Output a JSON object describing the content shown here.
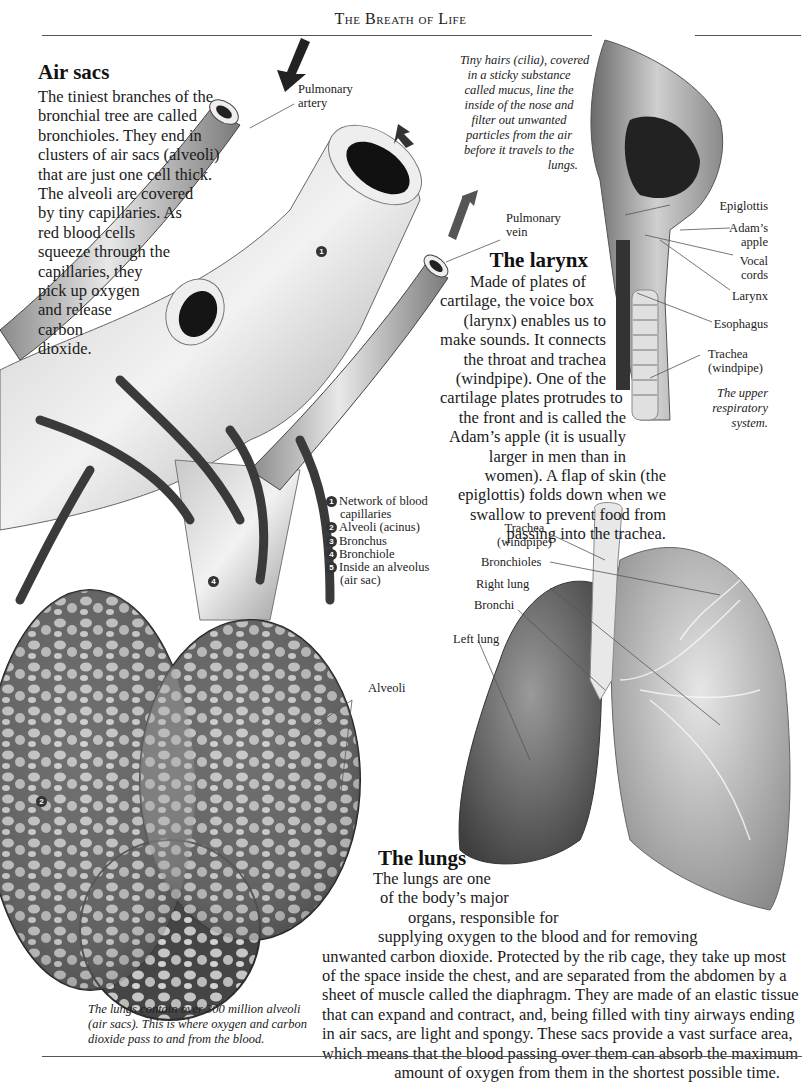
{
  "header": {
    "running_title": "The Breath of Life"
  },
  "air_sacs": {
    "heading": "Air sacs",
    "lines": [
      "The tiniest branches of the",
      "bronchial tree are called",
      "bronchioles. They end in",
      "clusters of air sacs (alveoli)",
      "that are just one cell thick.",
      "The alveoli are covered",
      "by tiny capillaries. As",
      "red blood cells",
      "squeeze through the",
      "capillaries, they",
      "pick up oxygen",
      "and release",
      "carbon",
      "dioxide."
    ]
  },
  "vessel_labels": {
    "pulmonary_artery": [
      "Pulmonary",
      "artery"
    ],
    "pulmonary_vein": [
      "Pulmonary",
      "vein"
    ],
    "alveoli": "Alveoli"
  },
  "figure_numbers": {
    "n1": "1",
    "n2": "2",
    "n4": "4"
  },
  "key": {
    "items": [
      {
        "num": "1",
        "lines": [
          "Network of blood",
          "capillaries"
        ]
      },
      {
        "num": "2",
        "lines": [
          "Alveoli (acinus)"
        ]
      },
      {
        "num": "3",
        "lines": [
          "Bronchus"
        ]
      },
      {
        "num": "4",
        "lines": [
          "Bronchiole"
        ]
      },
      {
        "num": "5",
        "lines": [
          "Inside an alveolus",
          "(air sac)"
        ]
      }
    ]
  },
  "cilia_caption": {
    "lines": [
      "Tiny hairs (cilia), covered",
      "in a sticky substance",
      "called mucus, line the",
      "inside of the nose and",
      "filter out unwanted",
      "particles from the air",
      "before it travels to the",
      "lungs."
    ]
  },
  "upper_labels": {
    "epiglottis": "Epiglottis",
    "adams_apple": [
      "Adam’s",
      "apple"
    ],
    "vocal_cords": [
      "Vocal",
      "cords"
    ],
    "larynx": "Larynx",
    "esophagus": "Esophagus",
    "trachea": [
      "Trachea",
      "(windpipe)"
    ],
    "caption": [
      "The upper",
      "respiratory",
      "system."
    ]
  },
  "larynx": {
    "heading": "The larynx",
    "lines": [
      "Made of plates of",
      "cartilage, the voice box",
      "(larynx) enables us to",
      "make sounds. It connects",
      "the throat and trachea",
      "(windpipe). One of the",
      "cartilage plates protrudes to",
      "the front and is called the",
      "Adam’s apple (it is usually",
      "larger in men than in",
      "women). A flap of skin (the",
      "epiglottis) folds down when we",
      "swallow to prevent food from",
      "passing into the trachea."
    ]
  },
  "lung_labels": {
    "trachea": [
      "Trachea",
      "(windpipe)"
    ],
    "bronchioles": "Bronchioles",
    "right_lung": "Right lung",
    "bronchi": "Bronchi",
    "left_lung": "Left lung"
  },
  "lungs": {
    "heading": "The lungs",
    "lines": [
      "The lungs are one",
      "of the body’s major",
      "organs, responsible for",
      "supplying oxygen to the blood and for removing",
      "unwanted carbon dioxide. Protected by the rib cage, they take up most",
      "of the space inside the chest, and are separated from the abdomen by a",
      "sheet of muscle called the diaphragm. They are made of an elastic tissue",
      "that can expand and contract, and, being filled with tiny airways ending",
      "in air sacs, are light and spongy. These sacs provide a vast surface area,",
      "which means that the blood passing over them can absorb the maximum",
      "amount of oxygen from them in the shortest possible time."
    ]
  },
  "alveoli_caption": {
    "lines": [
      "The lungs contain over 300 million alveoli",
      "(air sacs). This is where oxygen and carbon",
      "dioxide pass to and from the blood."
    ]
  }
}
